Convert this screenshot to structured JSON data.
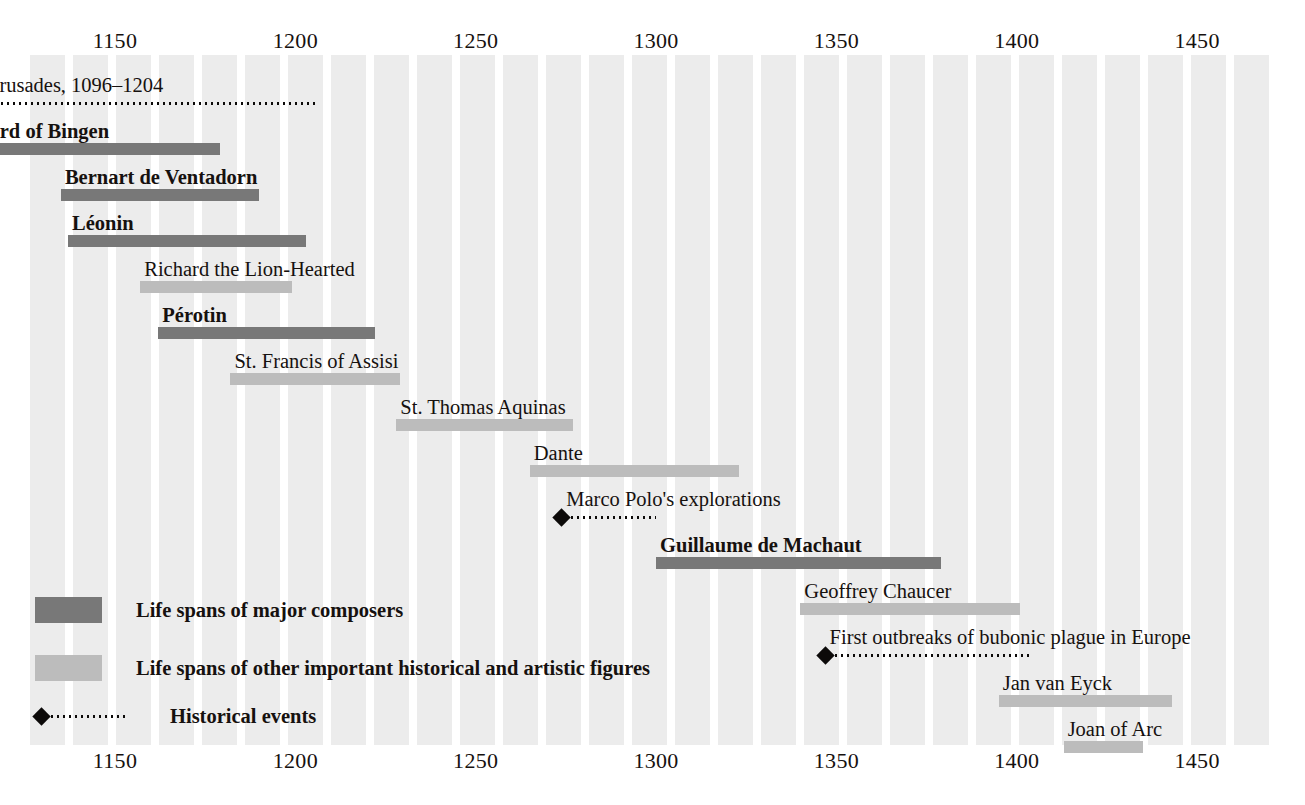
{
  "chart_data": {
    "type": "timeline",
    "xlabel": "Year",
    "xlim": [
      1125,
      1460
    ],
    "grid": "vertical-stripes",
    "axis_ticks": [
      {
        "label": "1150",
        "value": 1150
      },
      {
        "label": "1200",
        "value": 1200
      },
      {
        "label": "1250",
        "value": 1250
      },
      {
        "label": "1300",
        "value": 1300
      },
      {
        "label": "1350",
        "value": 1350
      },
      {
        "label": "1400",
        "value": 1400
      },
      {
        "label": "1450",
        "value": 1450
      }
    ],
    "axis_position": "both",
    "categories": [
      "Age of Crusades, 1096–1204",
      "Hildegard of Bingen",
      "Bernart de Ventadorn",
      "Léonin",
      "Richard the Lion-Hearted",
      "Pérotin",
      "St. Francis of Assisi",
      "St. Thomas Aquinas",
      "Dante",
      "Marco Polo's explorations",
      "Guillaume de Machaut",
      "Geoffrey Chaucer",
      "First outbreaks of bubonic plague in Europe",
      "Jan van Eyck",
      "Joan of Arc"
    ],
    "rows": [
      {
        "label": "Age of Crusades, 1096–1204",
        "kind": "event",
        "start": 1096,
        "end": 1204,
        "bold": false
      },
      {
        "label": "Hildegard of Bingen",
        "kind": "composer",
        "start": 1098,
        "end": 1179,
        "bold": true
      },
      {
        "label": "Bernart de Ventadorn",
        "kind": "composer",
        "start": 1135,
        "end": 1190,
        "bold": true
      },
      {
        "label": "Léonin",
        "kind": "composer",
        "start": 1137,
        "end": 1203,
        "bold": true
      },
      {
        "label": "Richard the Lion-Hearted",
        "kind": "figure",
        "start": 1157,
        "end": 1199,
        "bold": false
      },
      {
        "label": "Pérotin",
        "kind": "composer",
        "start": 1162,
        "end": 1222,
        "bold": true
      },
      {
        "label": "St. Francis of Assisi",
        "kind": "figure",
        "start": 1182,
        "end": 1229,
        "bold": false
      },
      {
        "label": "St. Thomas Aquinas",
        "kind": "figure",
        "start": 1228,
        "end": 1277,
        "bold": false
      },
      {
        "label": "Dante",
        "kind": "figure",
        "start": 1265,
        "end": 1323,
        "bold": false
      },
      {
        "label": "Marco Polo's explorations",
        "kind": "event",
        "start": 1274,
        "end": 1298,
        "bold": false
      },
      {
        "label": "Guillaume de Machaut",
        "kind": "composer",
        "start": 1300,
        "end": 1379,
        "bold": true
      },
      {
        "label": "Geoffrey Chaucer",
        "kind": "figure",
        "start": 1340,
        "end": 1401,
        "bold": false
      },
      {
        "label": "First outbreaks of bubonic plague in Europe",
        "kind": "event",
        "start": 1347,
        "end": 1402,
        "bold": false
      },
      {
        "label": "Jan van Eyck",
        "kind": "figure",
        "start": 1395,
        "end": 1443,
        "bold": false
      },
      {
        "label": "Joan of Arc",
        "kind": "figure",
        "start": 1413,
        "end": 1435,
        "bold": false
      }
    ],
    "legend": {
      "position": "bottom-left",
      "entries": [
        {
          "key": "composer",
          "label": "Life spans of major composers",
          "color": "#787878"
        },
        {
          "key": "figure",
          "label": "Life spans of other important historical and artistic figures",
          "color": "#bcbcbc"
        },
        {
          "key": "event",
          "label": "Historical events",
          "color": "#0c0a09"
        }
      ]
    },
    "colors": {
      "composer_bar": "#787878",
      "figure_bar": "#bcbcbc",
      "event_marker": "#0c0a09",
      "stripe": "#ececec",
      "background": "#ffffff",
      "text": "#16110f"
    }
  },
  "geometry": {
    "plot_left": 30,
    "plot_right": 1275,
    "plot_top": 55,
    "plot_bottom": 745,
    "x_at_1150": 115,
    "px_per_year": 3.607,
    "row_height": 46,
    "first_row_baseline": 95
  }
}
